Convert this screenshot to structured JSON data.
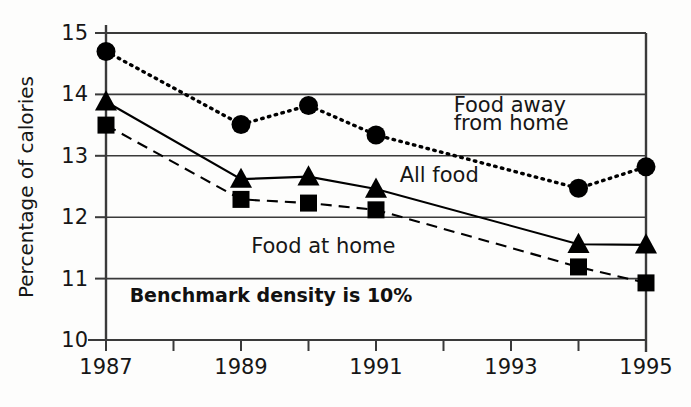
{
  "chart_data": {
    "type": "line",
    "title": "",
    "xlabel": "",
    "ylabel": "Percentage of calories",
    "x": [
      1987,
      1989,
      1990,
      1991,
      1994,
      1995
    ],
    "xlim": [
      1987,
      1995
    ],
    "ylim": [
      10,
      15
    ],
    "xticks": [
      1987,
      1988,
      1989,
      1990,
      1991,
      1992,
      1993,
      1994,
      1995
    ],
    "xtick_labels": [
      "1987",
      "",
      "1989",
      "",
      "1991",
      "",
      "1993",
      "",
      "1995"
    ],
    "yticks": [
      10,
      11,
      12,
      13,
      14,
      15
    ],
    "ytick_labels": [
      "10",
      "11",
      "12",
      "13",
      "14",
      "15"
    ],
    "grid": true,
    "grid_axis": "y",
    "legend_position": "inline-annotations",
    "series": [
      {
        "name": "Food away from home",
        "marker": "circle",
        "line_style": "dotted",
        "color": "#000000",
        "values": [
          14.7,
          13.51,
          13.82,
          13.34,
          12.47,
          12.82
        ]
      },
      {
        "name": "All food",
        "marker": "triangle",
        "line_style": "solid",
        "color": "#000000",
        "values": [
          13.88,
          12.62,
          12.66,
          12.46,
          11.56,
          11.55
        ]
      },
      {
        "name": "Food at home",
        "marker": "square",
        "line_style": "dashed",
        "color": "#000000",
        "values": [
          13.5,
          12.29,
          12.23,
          12.12,
          11.19,
          10.93
        ]
      }
    ],
    "annotations": [
      {
        "text": "Food away",
        "x": 1992.15,
        "y": 13.72,
        "name": "label-food-away-line1"
      },
      {
        "text": "from home",
        "x": 1992.15,
        "y": 13.42,
        "name": "label-food-away-line2"
      },
      {
        "text": "All food",
        "x": 1991.35,
        "y": 12.58,
        "name": "label-all-food"
      },
      {
        "text": "Food at home",
        "x": 1989.15,
        "y": 11.41,
        "name": "label-food-at-home"
      },
      {
        "text": "Benchmark density is 10%",
        "x": 1987.35,
        "y": 10.62,
        "name": "label-benchmark-note",
        "bold": true
      }
    ]
  },
  "axis": {
    "ylabel": "Percentage of calories"
  },
  "colors": {
    "ink": "#000000",
    "axis": "#3a3a3a",
    "background": "#fdfdfc"
  }
}
